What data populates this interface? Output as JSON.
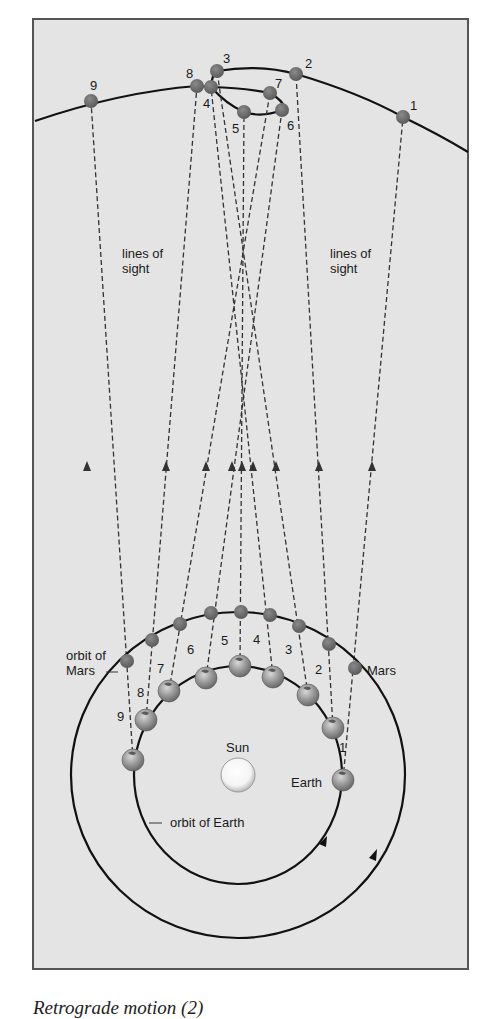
{
  "figure": {
    "caption": "Retrograde motion (2)",
    "background_color": "#e4e4e4",
    "frame_color": "#555555",
    "labels": {
      "lines_of_sight_left": [
        "lines of",
        "sight"
      ],
      "lines_of_sight_right": [
        "lines of",
        "sight"
      ],
      "orbit_of_mars": [
        "orbit of",
        "Mars"
      ],
      "mars": "Mars",
      "earth": "Earth",
      "sun": "Sun",
      "orbit_of_earth": "orbit of Earth"
    },
    "apparent_positions": [
      {
        "n": "1",
        "x": 403,
        "y": 117
      },
      {
        "n": "2",
        "x": 296,
        "y": 74
      },
      {
        "n": "3",
        "x": 217,
        "y": 71
      },
      {
        "n": "4",
        "x": 211,
        "y": 87
      },
      {
        "n": "5",
        "x": 244,
        "y": 112
      },
      {
        "n": "6",
        "x": 282,
        "y": 110
      },
      {
        "n": "7",
        "x": 270,
        "y": 93
      },
      {
        "n": "8",
        "x": 197,
        "y": 86
      },
      {
        "n": "9",
        "x": 91,
        "y": 101
      }
    ],
    "mars_positions": [
      {
        "n": "1",
        "x": 355,
        "y": 668
      },
      {
        "n": "2",
        "x": 329,
        "y": 644
      },
      {
        "n": "3",
        "x": 299,
        "y": 626
      },
      {
        "n": "4",
        "x": 270,
        "y": 615
      },
      {
        "n": "5",
        "x": 241,
        "y": 612
      },
      {
        "n": "6",
        "x": 211,
        "y": 613
      },
      {
        "n": "7",
        "x": 180,
        "y": 624
      },
      {
        "n": "8",
        "x": 152,
        "y": 640
      },
      {
        "n": "9",
        "x": 127,
        "y": 661
      }
    ],
    "earth_positions": [
      {
        "n": "1",
        "x": 343,
        "y": 780
      },
      {
        "n": "2",
        "x": 333,
        "y": 728
      },
      {
        "n": "3",
        "x": 308,
        "y": 695
      },
      {
        "n": "4",
        "x": 273,
        "y": 677
      },
      {
        "n": "5",
        "x": 240,
        "y": 666
      },
      {
        "n": "6",
        "x": 206,
        "y": 678
      },
      {
        "n": "7",
        "x": 169,
        "y": 691
      },
      {
        "n": "8",
        "x": 146,
        "y": 720
      },
      {
        "n": "9",
        "x": 133,
        "y": 760
      }
    ]
  }
}
